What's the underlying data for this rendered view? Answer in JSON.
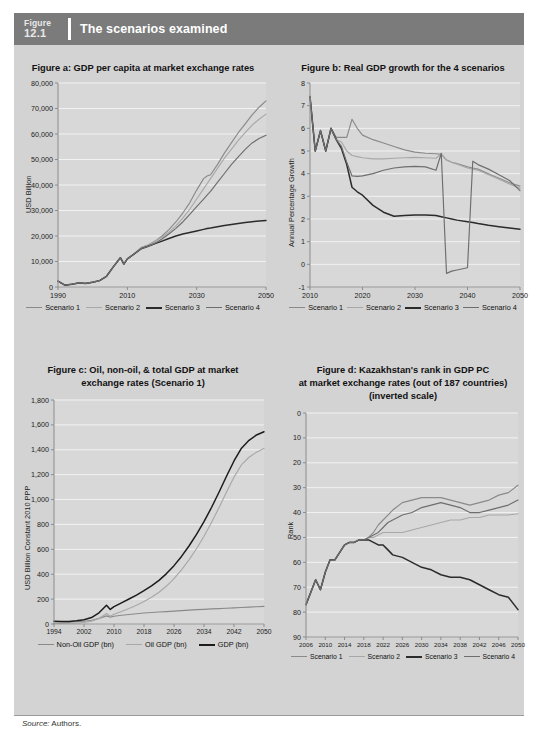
{
  "header": {
    "figure_word": "Figure",
    "figure_number": "12.1",
    "title": "The scenarios examined"
  },
  "footer": {
    "source_label": "Source:",
    "source_value": "Authors."
  },
  "colors": {
    "banner": "#7b7b7b",
    "panel": "#d3d3d3",
    "plot": "#d8d8d8",
    "gridline": "#f2f2f2",
    "axis": "#8c8c8c",
    "series1": "#8a8a8a",
    "series2": "#a8a8a8",
    "series3": "#2b2b2b",
    "series4": "#6e6e6e"
  },
  "chart_data": [
    {
      "id": "figure-a",
      "type": "line",
      "title": "Figure a: GDP per capita at market exchange rates",
      "xlabel": "",
      "ylabel": "USD Billion",
      "xlim": [
        1990,
        2050
      ],
      "ylim": [
        0,
        80000
      ],
      "xticks": [
        1990,
        2010,
        2030,
        2050
      ],
      "yticks": [
        0,
        10000,
        20000,
        30000,
        40000,
        50000,
        60000,
        70000,
        80000
      ],
      "ytick_labels": [
        "0",
        "10,000",
        "20,000",
        "30,000",
        "40,000",
        "50,000",
        "60,000",
        "70,000",
        "80,000"
      ],
      "grid": true,
      "legend_position": "bottom",
      "x": [
        1990,
        1992,
        1994,
        1996,
        1998,
        2000,
        2002,
        2004,
        2006,
        2008,
        2009,
        2010,
        2012,
        2014,
        2016,
        2018,
        2020,
        2022,
        2024,
        2026,
        2028,
        2030,
        2032,
        2033,
        2034,
        2036,
        2038,
        2040,
        2042,
        2044,
        2046,
        2048,
        2050
      ],
      "series": [
        {
          "name": "Scenario 1",
          "color": "#8a8a8a",
          "values": [
            2300,
            700,
            1100,
            1600,
            1400,
            1900,
            2500,
            4200,
            8000,
            11500,
            9000,
            11000,
            13000,
            15500,
            16500,
            18000,
            20000,
            22500,
            25500,
            29000,
            33000,
            38000,
            42500,
            43500,
            44000,
            48000,
            52500,
            56500,
            60500,
            64000,
            67500,
            70500,
            73000
          ]
        },
        {
          "name": "Scenario 2",
          "color": "#a8a8a8",
          "values": [
            2300,
            700,
            1100,
            1600,
            1400,
            1900,
            2500,
            4200,
            8000,
            11500,
            9000,
            11000,
            13000,
            15500,
            16500,
            17800,
            19500,
            21500,
            24000,
            27000,
            30500,
            34500,
            38500,
            40500,
            42500,
            46500,
            50500,
            54000,
            57500,
            60500,
            63500,
            65800,
            67800
          ]
        },
        {
          "name": "Scenario 3",
          "color": "#2b2b2b",
          "values": [
            2300,
            700,
            1100,
            1600,
            1400,
            1900,
            2500,
            4200,
            8000,
            11500,
            9000,
            11000,
            13000,
            15000,
            16000,
            17000,
            18000,
            19000,
            20000,
            20800,
            21400,
            22000,
            22600,
            22900,
            23100,
            23600,
            24100,
            24500,
            24900,
            25300,
            25600,
            25900,
            26100
          ]
        },
        {
          "name": "Scenario 4",
          "color": "#6e6e6e",
          "values": [
            2300,
            700,
            1100,
            1600,
            1400,
            1900,
            2500,
            4200,
            8000,
            11500,
            9000,
            11000,
            13000,
            15000,
            16000,
            17200,
            18800,
            20800,
            23000,
            25500,
            28500,
            31500,
            34500,
            36000,
            37500,
            41000,
            44500,
            48000,
            51000,
            54000,
            56500,
            58200,
            59500
          ]
        }
      ]
    },
    {
      "id": "figure-b",
      "type": "line",
      "title": "Figure b: Real GDP growth for the 4 scenarios",
      "xlabel": "",
      "ylabel": "Annual Percentage Growth",
      "xlim": [
        2010,
        2050
      ],
      "ylim": [
        -1,
        8
      ],
      "xticks": [
        2010,
        2020,
        2030,
        2040,
        2050
      ],
      "yticks": [
        -1,
        0,
        1,
        2,
        3,
        4,
        5,
        6,
        7,
        8
      ],
      "ytick_labels": [
        "-1",
        "0",
        "1",
        "2",
        "3",
        "4",
        "5",
        "6",
        "7",
        "8"
      ],
      "grid": true,
      "legend_position": "bottom",
      "x": [
        2010,
        2011,
        2012,
        2013,
        2014,
        2015,
        2016,
        2017,
        2018,
        2019,
        2020,
        2022,
        2024,
        2026,
        2028,
        2030,
        2032,
        2034,
        2035,
        2036,
        2037,
        2038,
        2040,
        2041,
        2042,
        2044,
        2046,
        2048,
        2050
      ],
      "series": [
        {
          "name": "Scenario 1",
          "color": "#8a8a8a",
          "values": [
            7.4,
            5.0,
            5.9,
            5.0,
            6.0,
            5.6,
            5.6,
            5.6,
            6.4,
            6.0,
            5.7,
            5.5,
            5.35,
            5.2,
            5.05,
            4.95,
            4.9,
            4.88,
            4.85,
            4.6,
            4.5,
            4.45,
            4.3,
            4.25,
            4.2,
            4.0,
            3.8,
            3.6,
            3.45
          ]
        },
        {
          "name": "Scenario 2",
          "color": "#a8a8a8",
          "values": [
            7.4,
            5.0,
            5.9,
            5.0,
            6.0,
            5.5,
            5.4,
            5.0,
            4.8,
            4.75,
            4.7,
            4.65,
            4.65,
            4.68,
            4.7,
            4.72,
            4.7,
            4.68,
            4.88,
            4.6,
            4.5,
            4.42,
            4.25,
            4.2,
            4.15,
            3.95,
            3.75,
            3.55,
            3.35
          ]
        },
        {
          "name": "Scenario 3",
          "color": "#2b2b2b",
          "values": [
            7.4,
            5.0,
            5.9,
            5.0,
            6.0,
            5.5,
            5.1,
            4.4,
            3.4,
            3.2,
            3.05,
            2.6,
            2.3,
            2.12,
            2.15,
            2.18,
            2.18,
            2.15,
            2.1,
            2.05,
            2.0,
            1.95,
            1.88,
            1.85,
            1.8,
            1.72,
            1.66,
            1.6,
            1.55
          ]
        },
        {
          "name": "Scenario 4",
          "color": "#6e6e6e",
          "values": [
            7.4,
            5.0,
            5.9,
            5.0,
            6.0,
            5.5,
            5.2,
            4.5,
            3.9,
            3.88,
            3.9,
            4.0,
            4.15,
            4.25,
            4.3,
            4.32,
            4.3,
            4.15,
            4.9,
            -0.4,
            -0.3,
            -0.25,
            -0.15,
            4.55,
            4.4,
            4.2,
            3.95,
            3.7,
            3.25
          ]
        }
      ]
    },
    {
      "id": "figure-c",
      "type": "line",
      "title": "Figure c: Oil, non-oil, & total GDP at market exchange rates (Scenario 1)",
      "title_lines": [
        "Figure c: Oil, non-oil, & total GDP at market",
        "exchange rates (Scenario 1)"
      ],
      "xlabel": "",
      "ylabel": "USD Billion Constant 2010 PPP",
      "xlim": [
        1994,
        2050
      ],
      "ylim": [
        0,
        1800
      ],
      "xticks": [
        1994,
        2002,
        2010,
        2018,
        2026,
        2034,
        2042,
        2050
      ],
      "yticks": [
        0,
        200,
        400,
        600,
        800,
        1000,
        1200,
        1400,
        1600,
        1800
      ],
      "ytick_labels": [
        "0",
        "200",
        "400",
        "600",
        "800",
        "1,000",
        "1,200",
        "1,400",
        "1,600",
        "1,800"
      ],
      "grid": true,
      "legend_position": "bottom",
      "x": [
        1994,
        1996,
        1998,
        2000,
        2002,
        2004,
        2006,
        2008,
        2009,
        2010,
        2012,
        2014,
        2016,
        2018,
        2020,
        2022,
        2024,
        2026,
        2028,
        2030,
        2032,
        2034,
        2036,
        2038,
        2040,
        2042,
        2044,
        2046,
        2048,
        2050
      ],
      "series": [
        {
          "name": "Non-Oil GDP (bn)",
          "color": "#8a8a8a",
          "values": [
            18,
            16,
            15,
            18,
            22,
            30,
            45,
            65,
            55,
            62,
            70,
            76,
            82,
            88,
            92,
            96,
            100,
            104,
            108,
            112,
            115,
            118,
            121,
            124,
            127,
            130,
            133,
            136,
            139,
            142
          ]
        },
        {
          "name": "Oil GDP (bn)",
          "color": "#a8a8a8",
          "values": [
            5,
            5,
            6,
            8,
            12,
            22,
            45,
            85,
            62,
            78,
            100,
            125,
            150,
            180,
            215,
            255,
            305,
            365,
            435,
            515,
            605,
            705,
            815,
            935,
            1060,
            1180,
            1280,
            1340,
            1380,
            1410
          ]
        },
        {
          "name": "GDP (bn)",
          "color": "#1c1c1c",
          "values": [
            23,
            21,
            21,
            26,
            34,
            52,
            90,
            150,
            117,
            140,
            170,
            201,
            232,
            268,
            307,
            351,
            405,
            469,
            543,
            627,
            720,
            823,
            936,
            1059,
            1187,
            1310,
            1413,
            1476,
            1519,
            1545
          ]
        }
      ]
    },
    {
      "id": "figure-d",
      "type": "line",
      "title": "Figure d: Kazakhstan's rank in GDP PC at market exchange rates (out of 187 countries) (inverted scale)",
      "title_lines": [
        "Figure d: Kazakhstan's rank in GDP PC",
        "at market exchange rates (out of 187 countries)",
        "(inverted scale)"
      ],
      "xlabel": "",
      "ylabel": "Rank",
      "xlim": [
        2006,
        2050
      ],
      "ylim": [
        0,
        90
      ],
      "inverted_yaxis": true,
      "xticks": [
        2006,
        2010,
        2014,
        2018,
        2022,
        2026,
        2030,
        2034,
        2038,
        2042,
        2046,
        2050
      ],
      "yticks": [
        0,
        10,
        20,
        30,
        40,
        50,
        60,
        70,
        80,
        90
      ],
      "ytick_labels": [
        "0",
        "10",
        "20",
        "30",
        "40",
        "50",
        "60",
        "70",
        "80",
        "90"
      ],
      "grid": true,
      "legend_position": "bottom",
      "x": [
        2006,
        2007,
        2008,
        2009,
        2010,
        2011,
        2012,
        2013,
        2014,
        2015,
        2016,
        2017,
        2018,
        2019,
        2020,
        2021,
        2022,
        2023,
        2024,
        2026,
        2028,
        2030,
        2032,
        2034,
        2036,
        2038,
        2040,
        2042,
        2044,
        2046,
        2048,
        2050
      ],
      "series": [
        {
          "name": "Scenario 1",
          "color": "#8a8a8a",
          "values": [
            77,
            72,
            67,
            71,
            64,
            59,
            59,
            56,
            53,
            52,
            52,
            51,
            51,
            50,
            48,
            45,
            43,
            41,
            39,
            36,
            35,
            34,
            34,
            34,
            35,
            36,
            37,
            36,
            35,
            33,
            32,
            29
          ]
        },
        {
          "name": "Scenario 2",
          "color": "#a8a8a8",
          "values": [
            77,
            72,
            67,
            71,
            64,
            59,
            59,
            56,
            53,
            52,
            52,
            51,
            51,
            50,
            50,
            49,
            48,
            48,
            48,
            48,
            47,
            46,
            45,
            44,
            43,
            43,
            42,
            42,
            41,
            41,
            41,
            40.5
          ]
        },
        {
          "name": "Scenario 3",
          "color": "#2b2b2b",
          "values": [
            77,
            72,
            67,
            71,
            64,
            59,
            59,
            56,
            53,
            52,
            52,
            51,
            51,
            51,
            52,
            53,
            53,
            55,
            57,
            58,
            60,
            62,
            63,
            65,
            66,
            66,
            67,
            69,
            71,
            73,
            74,
            79
          ]
        },
        {
          "name": "Scenario 4",
          "color": "#6e6e6e",
          "values": [
            77,
            72,
            67,
            71,
            64,
            59,
            59,
            56,
            53,
            52,
            52,
            51,
            51,
            50,
            49,
            48,
            46,
            44,
            43,
            41,
            40,
            38,
            37,
            36,
            37,
            38,
            40,
            40,
            39,
            38,
            37,
            35
          ]
        }
      ]
    }
  ]
}
